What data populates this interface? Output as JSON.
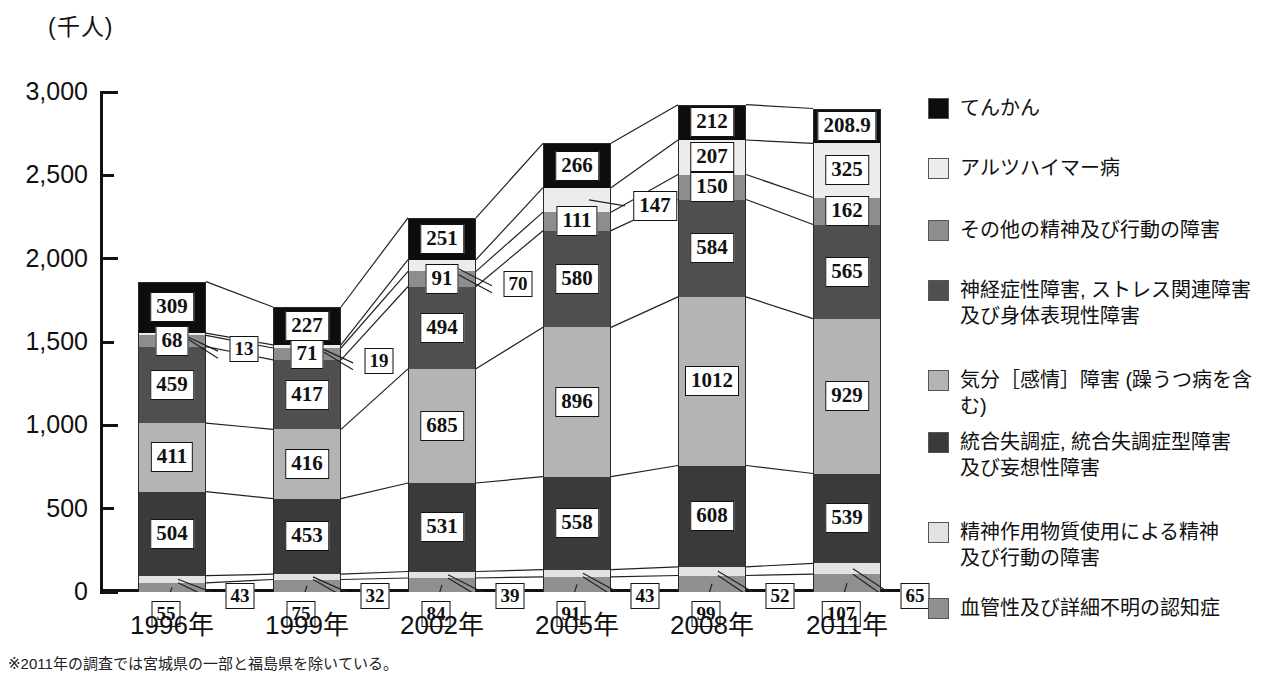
{
  "axis": {
    "unit_label": "(千人)",
    "y_ticks": [
      "3,000",
      "2,500",
      "2,000",
      "1,500",
      "1,000",
      "500",
      "0"
    ],
    "y_min": 0,
    "y_max": 3000,
    "x_labels": [
      "1996年",
      "1999年",
      "2002年",
      "2005年",
      "2008年",
      "2011年"
    ]
  },
  "footnote": "※2011年の調査では宮城県の一部と福島県を除いている。",
  "legend": {
    "items": [
      {
        "label": "てんかん",
        "color": "#0d0d0d",
        "key": "epilepsy"
      },
      {
        "label": "アルツハイマー病",
        "color": "#ececec",
        "key": "alzheimer"
      },
      {
        "label": "その他の精神及び行動の障害",
        "color": "#8d8d8d",
        "key": "other-mental"
      },
      {
        "label": "神経症性障害, ストレス関連障害\n及び身体表現性障害",
        "color": "#4f4f4f",
        "key": "neurotic"
      },
      {
        "label": "気分［感情］障害 (躁うつ病を含む)",
        "color": "#b4b4b4",
        "key": "mood"
      },
      {
        "label": "統合失調症, 統合失調症型障害\n及び妄想性障害",
        "color": "#3a3a3a",
        "key": "schizophrenia"
      },
      {
        "label": "精神作用物質使用による精神\n及び行動の障害",
        "color": "#e2e2e2",
        "key": "substance"
      },
      {
        "label": "血管性及び詳細不明の認知症",
        "color": "#909090",
        "key": "vascular-dementia"
      }
    ]
  },
  "chart_data": {
    "type": "bar",
    "stacked": true,
    "title": "",
    "xlabel": "",
    "ylabel": "(千人)",
    "ylim": [
      0,
      3000
    ],
    "grid": false,
    "legend_position": "right",
    "categories": [
      "1996年",
      "1999年",
      "2002年",
      "2005年",
      "2008年",
      "2011年"
    ],
    "series": [
      {
        "name": "血管性及び詳細不明の認知症",
        "color": "#909090",
        "values": [
          55,
          75,
          84,
          91,
          99,
          107
        ]
      },
      {
        "name": "精神作用物質使用による精神及び行動の障害",
        "color": "#e2e2e2",
        "values": [
          43,
          32,
          39,
          43,
          52,
          65
        ]
      },
      {
        "name": "統合失調症, 統合失調症型障害及び妄想性障害",
        "color": "#3a3a3a",
        "values": [
          504,
          453,
          531,
          558,
          608,
          539
        ]
      },
      {
        "name": "気分［感情］障害 (躁うつ病を含む)",
        "color": "#b4b4b4",
        "values": [
          411,
          416,
          685,
          896,
          1012,
          929
        ]
      },
      {
        "name": "神経症性障害, ストレス関連障害及び身体表現性障害",
        "color": "#4f4f4f",
        "values": [
          459,
          417,
          494,
          580,
          584,
          565
        ]
      },
      {
        "name": "その他の精神及び行動の障害",
        "color": "#8d8d8d",
        "values": [
          68,
          71,
          91,
          111,
          150,
          162
        ]
      },
      {
        "name": "アルツハイマー病",
        "color": "#ececec",
        "values": [
          13,
          19,
          70,
          147,
          207,
          325
        ]
      },
      {
        "name": "てんかん",
        "color": "#0d0d0d",
        "values": [
          309,
          227,
          251,
          266,
          212,
          208.9
        ]
      }
    ],
    "value_labels": {
      "1996年": {
        "vascular-dementia": "55",
        "substance": "43",
        "schizophrenia": "504",
        "mood": "411",
        "neurotic": "459",
        "other-mental": "68",
        "alzheimer": "13",
        "epilepsy": "309"
      },
      "1999年": {
        "vascular-dementia": "75",
        "substance": "32",
        "schizophrenia": "453",
        "mood": "416",
        "neurotic": "417",
        "other-mental": "71",
        "alzheimer": "19",
        "epilepsy": "227"
      },
      "2002年": {
        "vascular-dementia": "84",
        "substance": "39",
        "schizophrenia": "531",
        "mood": "685",
        "neurotic": "494",
        "other-mental": "91",
        "alzheimer": "70",
        "epilepsy": "251"
      },
      "2005年": {
        "vascular-dementia": "91",
        "substance": "43",
        "schizophrenia": "558",
        "mood": "896",
        "neurotic": "580",
        "other-mental": "111",
        "alzheimer": "147",
        "epilepsy": "266"
      },
      "2008年": {
        "vascular-dementia": "99",
        "substance": "52",
        "schizophrenia": "608",
        "mood": "1012",
        "neurotic": "584",
        "other-mental": "150",
        "alzheimer": "207",
        "epilepsy": "212"
      },
      "2011年": {
        "vascular-dementia": "107",
        "substance": "65",
        "schizophrenia": "539",
        "mood": "929",
        "neurotic": "565",
        "other-mental": "162",
        "alzheimer": "325",
        "epilepsy": "208.9"
      }
    }
  }
}
